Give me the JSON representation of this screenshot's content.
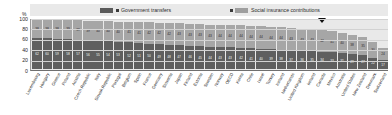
{
  "axis": {
    "percent_sign": "%",
    "yticks": [
      "100",
      "80",
      "60",
      "40",
      "20",
      "0"
    ]
  },
  "legend": {
    "series_a": "Government transfers",
    "series_b": "Social insurance contributions"
  },
  "marker": {
    "name": "oecd-average-marker",
    "country": "Canada"
  },
  "chart_data": {
    "type": "bar",
    "subtype": "stacked-bar-100",
    "title": "",
    "xlabel": "",
    "ylabel": "%",
    "ylim": [
      0,
      100
    ],
    "yticks": [
      0,
      20,
      40,
      60,
      80,
      100
    ],
    "grid": true,
    "legend_position": "top",
    "stack_colors": {
      "government_transfers": "#5f5f5f",
      "social_insurance_contributions": "#a6a6a6"
    },
    "categories": [
      "Luxembourg",
      "Hungary",
      "Greece",
      "Poland",
      "Austria",
      "Czech Republic",
      "Italy",
      "Slovak Republic",
      "Portugal",
      "Belgium",
      "Spain",
      "France",
      "Germany",
      "Slovenia",
      "Japan",
      "Finland",
      "Estonia",
      "Sweden",
      "Norway",
      "OECD",
      "Korea",
      "Chile",
      "Israel",
      "Turkey",
      "Iceland",
      "Netherlands",
      "United Kingdom",
      "Ireland",
      "Canada",
      "Mexico",
      "Australia",
      "United States",
      "New Zealand",
      "Denmark",
      "Switzerland"
    ],
    "series": [
      {
        "name": "Government transfers",
        "color": "#5f5f5f",
        "values": [
          62,
          60,
          59,
          58,
          57,
          56,
          55,
          54,
          53,
          52,
          51,
          50,
          49,
          48,
          47,
          46,
          45,
          44,
          43,
          43,
          42,
          41,
          40,
          39,
          38,
          37,
          36,
          35,
          34,
          33,
          31,
          29,
          27,
          22,
          17
        ]
      },
      {
        "name": "Social insurance contributions",
        "color": "#a6a6a6",
        "values": [
          38,
          38,
          38,
          39,
          39,
          39,
          40,
          40,
          40,
          41,
          41,
          42,
          42,
          42,
          43,
          43,
          43,
          43,
          44,
          44,
          44,
          44,
          44,
          44,
          44,
          43,
          43,
          43,
          42,
          41,
          40,
          38,
          35,
          30,
          24
        ]
      }
    ]
  }
}
